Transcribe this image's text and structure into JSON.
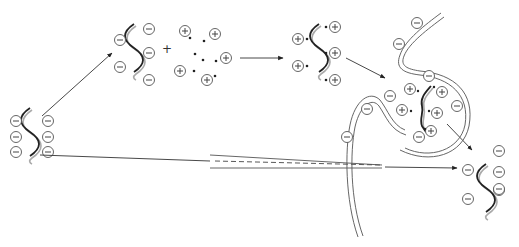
{
  "diagram": {
    "title": "",
    "colors": {
      "background": "#ffffff",
      "stroke": "#333333",
      "dna_strand": "#222222",
      "dna_shadow": "#aaaaaa"
    },
    "nodes": [
      {
        "id": "free-dna",
        "label": "",
        "charges": "negative",
        "count": 6,
        "x": 28,
        "y": 135
      },
      {
        "id": "dna-plus-cations",
        "label": "",
        "charges": "negative",
        "operator": "+",
        "cation_count": 6,
        "x": 180,
        "y": 45
      },
      {
        "id": "dna-cation-complex",
        "label": "",
        "charges": "positive",
        "count": 6,
        "x": 315,
        "y": 45
      },
      {
        "id": "endocytic-vesicle",
        "label": "",
        "contents": "dna-cation-complex",
        "x": 420,
        "y": 110
      },
      {
        "id": "released-dna",
        "label": "",
        "charges": "negative",
        "count": 6,
        "x": 490,
        "y": 195
      }
    ],
    "edges": [
      {
        "from": "free-dna",
        "to": "dna-plus-cations",
        "type": "arrow"
      },
      {
        "from": "dna-plus-cations",
        "to": "dna-cation-complex",
        "type": "arrow"
      },
      {
        "from": "dna-cation-complex",
        "to": "endocytic-vesicle",
        "type": "arrow"
      },
      {
        "from": "endocytic-vesicle",
        "to": "released-dna",
        "type": "arrow"
      },
      {
        "from": "free-dna",
        "to": "released-dna",
        "type": "arrow",
        "via": "microinjection-needle"
      }
    ],
    "symbols": {
      "negative_ion": "⊖",
      "positive_ion": "⊕",
      "plus_operator": "+"
    }
  }
}
